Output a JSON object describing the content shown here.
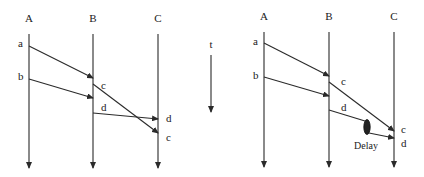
{
  "left_diagram": {
    "processes": [
      "A",
      "B",
      "C"
    ],
    "messages": [
      {
        "name": "a",
        "from": "A",
        "to": "B"
      },
      {
        "name": "b",
        "from": "A",
        "to": "B"
      },
      {
        "name": "c",
        "from": "B",
        "to": "C"
      },
      {
        "name": "d",
        "from": "B",
        "to": "C"
      }
    ],
    "send_labels": [
      "a",
      "b",
      "c",
      "d"
    ],
    "receive_labels_at_C": [
      "d",
      "c"
    ]
  },
  "time_axis": {
    "label": "t"
  },
  "right_diagram": {
    "processes": [
      "A",
      "B",
      "C"
    ],
    "messages": [
      {
        "name": "a",
        "from": "A",
        "to": "B"
      },
      {
        "name": "b",
        "from": "A",
        "to": "B"
      },
      {
        "name": "c",
        "from": "B",
        "to": "C"
      },
      {
        "name": "d",
        "from": "B",
        "to": "C",
        "delayed": true
      }
    ],
    "send_labels": [
      "a",
      "b",
      "c",
      "d"
    ],
    "receive_labels_at_C": [
      "c",
      "d"
    ],
    "delay_label": "Delay"
  },
  "colors": {
    "ink": "#2a2a2a",
    "background": "#ffffff"
  }
}
